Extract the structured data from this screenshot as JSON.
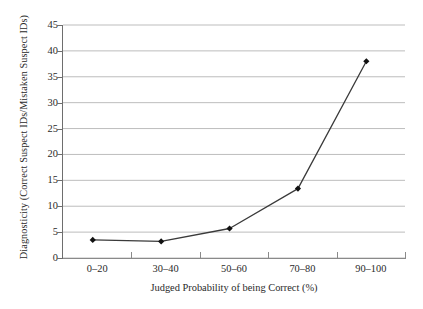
{
  "chart_data": {
    "type": "line",
    "title": "",
    "xlabel": "Judged Probability of being Correct (%)",
    "ylabel": "Diagnosticity (Correct Suspect IDs/Mistaken Suspect IDs)",
    "categories": [
      "0–20",
      "30–40",
      "50–60",
      "70–80",
      "90–100"
    ],
    "values": [
      3.5,
      3.2,
      5.7,
      13.4,
      38.0
    ],
    "series": [
      {
        "name": "Diagnosticity",
        "values": [
          3.5,
          3.2,
          5.7,
          13.4,
          38.0
        ]
      }
    ],
    "ylim": [
      0,
      45
    ],
    "yticks": [
      0,
      5,
      10,
      15,
      20,
      25,
      30,
      35,
      40,
      45
    ],
    "ytick_labels": [
      "0",
      "5",
      "10",
      "15",
      "20",
      "25",
      "30",
      "35",
      "40",
      "45"
    ],
    "grid": "horizontal",
    "legend": "none",
    "marker": "diamond",
    "line_color": "#3a3a3a",
    "marker_color": "#111111",
    "grid_color": "#b5b5b5",
    "axis_color": "#6e6e6e",
    "background_color": "#ffffff"
  }
}
